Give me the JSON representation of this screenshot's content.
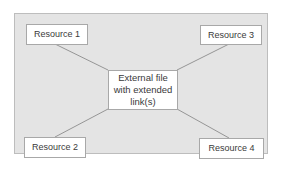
{
  "diagram": {
    "center": {
      "lines": [
        "External file",
        "with extended",
        "link(s)"
      ]
    },
    "resources": [
      {
        "label": "Resource 1",
        "position": "top-left"
      },
      {
        "label": "Resource 2",
        "position": "bottom-left"
      },
      {
        "label": "Resource 3",
        "position": "top-right"
      },
      {
        "label": "Resource 4",
        "position": "bottom-right"
      }
    ],
    "colors": {
      "panel": "#e4e4e4",
      "box": "#ffffff",
      "border": "#a8a8a8",
      "connector": "#8c8c8c",
      "text": "#3a3a3a"
    }
  }
}
